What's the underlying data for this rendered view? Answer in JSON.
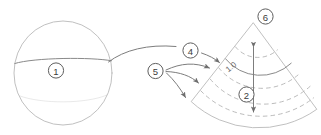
{
  "figure": {
    "background_color": "#ffffff",
    "line_color": "#b9b9b9",
    "accent_line_color": "#8a8a8a",
    "leader_color": "#7d7d7d",
    "label_text_color": "#3b3b3b",
    "width": 321,
    "height": 135
  },
  "callouts": {
    "sphere_label": "1",
    "depth_label": "2",
    "mapping_label": "4",
    "rays_label": "5",
    "apex_label": "6"
  },
  "annotations": {
    "scale_value": "1.0"
  },
  "shapes": {
    "sphere": {
      "name": "sphere",
      "cx": 63,
      "cy": 73,
      "rx": 49,
      "ry": 52
    },
    "sector": {
      "name": "sector-fan",
      "apex_x": 253,
      "apex_y": 23,
      "inner_radius": 40,
      "outer_radius": 95
    }
  }
}
